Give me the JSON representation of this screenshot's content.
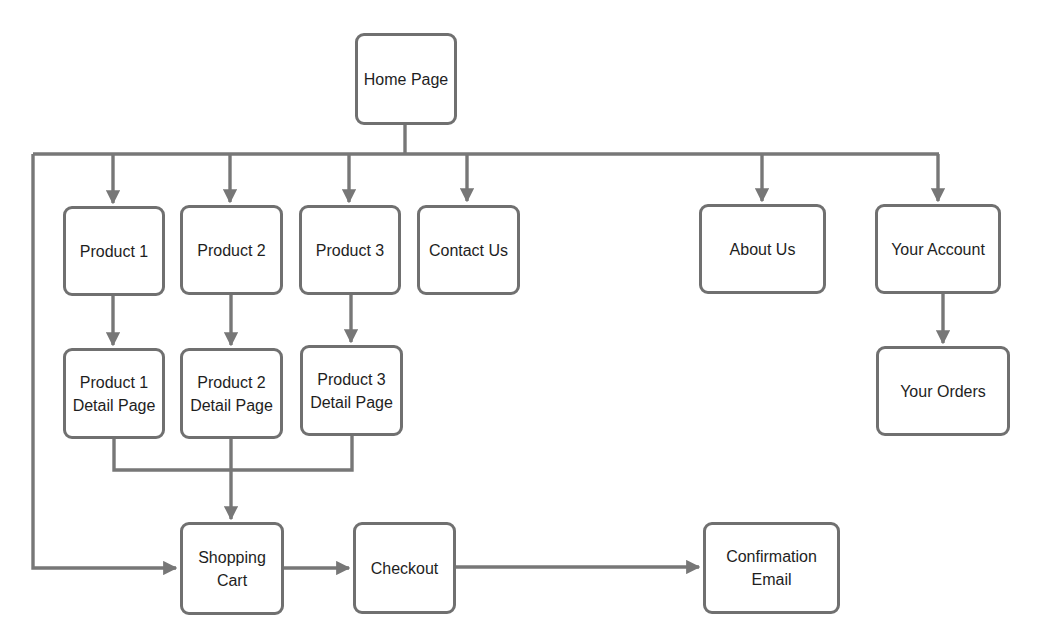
{
  "diagram": {
    "line_color": "#777777",
    "nodes": {
      "home": {
        "label": "Home Page",
        "x": 355,
        "y": 33,
        "w": 102,
        "h": 92
      },
      "product1": {
        "label": "Product 1",
        "x": 63,
        "y": 206,
        "w": 102,
        "h": 90
      },
      "product2": {
        "label": "Product 2",
        "x": 180,
        "y": 205,
        "w": 103,
        "h": 90
      },
      "product3": {
        "label": "Product 3",
        "x": 299,
        "y": 205,
        "w": 102,
        "h": 90
      },
      "contact": {
        "label": "Contact Us",
        "x": 417,
        "y": 205,
        "w": 103,
        "h": 90
      },
      "about": {
        "label": "About Us",
        "x": 699,
        "y": 204,
        "w": 127,
        "h": 90
      },
      "account": {
        "label": "Your Account",
        "x": 875,
        "y": 204,
        "w": 126,
        "h": 90
      },
      "p1detail": {
        "label": "Product 1\nDetail Page",
        "x": 63,
        "y": 348,
        "w": 102,
        "h": 91
      },
      "p2detail": {
        "label": "Product 2\nDetail Page",
        "x": 180,
        "y": 348,
        "w": 103,
        "h": 91
      },
      "p3detail": {
        "label": "Product 3\nDetail Page",
        "x": 300,
        "y": 345,
        "w": 103,
        "h": 91
      },
      "orders": {
        "label": "Your Orders",
        "x": 876,
        "y": 346,
        "w": 134,
        "h": 90
      },
      "cart": {
        "label": "Shopping\nCart",
        "x": 180,
        "y": 522,
        "w": 104,
        "h": 93
      },
      "checkout": {
        "label": "Checkout",
        "x": 353,
        "y": 522,
        "w": 103,
        "h": 92
      },
      "confirmation": {
        "label": "Confirmation\nEmail",
        "x": 703,
        "y": 522,
        "w": 137,
        "h": 92
      }
    },
    "edges": [
      {
        "from": "home",
        "to": "product1"
      },
      {
        "from": "home",
        "to": "product2"
      },
      {
        "from": "home",
        "to": "product3"
      },
      {
        "from": "home",
        "to": "contact"
      },
      {
        "from": "home",
        "to": "about"
      },
      {
        "from": "home",
        "to": "account"
      },
      {
        "from": "home",
        "to": "cart"
      },
      {
        "from": "product1",
        "to": "p1detail"
      },
      {
        "from": "product2",
        "to": "p2detail"
      },
      {
        "from": "product3",
        "to": "p3detail"
      },
      {
        "from": "account",
        "to": "orders"
      },
      {
        "from": "p1detail",
        "to": "cart"
      },
      {
        "from": "p2detail",
        "to": "cart"
      },
      {
        "from": "p3detail",
        "to": "cart"
      },
      {
        "from": "cart",
        "to": "checkout"
      },
      {
        "from": "checkout",
        "to": "confirmation"
      }
    ]
  }
}
